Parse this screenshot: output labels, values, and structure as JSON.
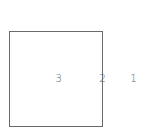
{
  "diagram": {
    "shape": "square",
    "stroke_color": "#6a6a6a",
    "labels": [
      {
        "text": "3",
        "position": "inside-center"
      },
      {
        "text": "2",
        "position": "on-right-edge"
      },
      {
        "text": "1",
        "position": "outside-right"
      }
    ]
  }
}
